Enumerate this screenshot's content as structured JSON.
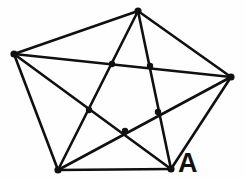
{
  "figure": {
    "kind": "graph-drawing",
    "background_color": "#fefefe",
    "edge_color": "#101010",
    "vertex_color": "#101010",
    "label_color": "#101010",
    "edge_width": 2.6,
    "vertex_radius": 3.6,
    "crossing_dot_radius": 3.2,
    "canvas": {
      "width": 246,
      "height": 180
    }
  },
  "graph_data": {
    "type": "graph",
    "name": "K5",
    "vertex_count": 5,
    "edge_count": 10,
    "vertices": [
      {
        "id": "top",
        "x": 138,
        "y": 11,
        "label": ""
      },
      {
        "id": "left",
        "x": 14,
        "y": 54,
        "label": ""
      },
      {
        "id": "right",
        "x": 231,
        "y": 77,
        "label": ""
      },
      {
        "id": "bottom_left",
        "x": 58,
        "y": 170,
        "label": ""
      },
      {
        "id": "bottom_right",
        "x": 171,
        "y": 169,
        "label": "A"
      }
    ],
    "edges": [
      {
        "from": "top",
        "to": "left",
        "kind": "side"
      },
      {
        "from": "top",
        "to": "right",
        "kind": "side"
      },
      {
        "from": "right",
        "to": "bottom_right",
        "kind": "side"
      },
      {
        "from": "bottom_right",
        "to": "bottom_left",
        "kind": "side"
      },
      {
        "from": "bottom_left",
        "to": "left",
        "kind": "side"
      },
      {
        "from": "top",
        "to": "bottom_left",
        "kind": "diagonal"
      },
      {
        "from": "top",
        "to": "bottom_right",
        "kind": "diagonal"
      },
      {
        "from": "left",
        "to": "right",
        "kind": "diagonal"
      },
      {
        "from": "left",
        "to": "bottom_right",
        "kind": "diagonal"
      },
      {
        "from": "right",
        "to": "bottom_left",
        "kind": "diagonal"
      }
    ],
    "crossings": [
      {
        "id": "crossing-upper-left",
        "x": 112,
        "y": 64
      },
      {
        "id": "crossing-upper-right",
        "x": 150,
        "y": 66
      },
      {
        "id": "crossing-mid-left",
        "x": 89,
        "y": 110
      },
      {
        "id": "crossing-mid-right",
        "x": 158,
        "y": 112
      },
      {
        "id": "crossing-bottom",
        "x": 125,
        "y": 131
      }
    ]
  },
  "labels": {
    "vertex_a": {
      "text": "A",
      "x": 178,
      "y": 150
    }
  }
}
